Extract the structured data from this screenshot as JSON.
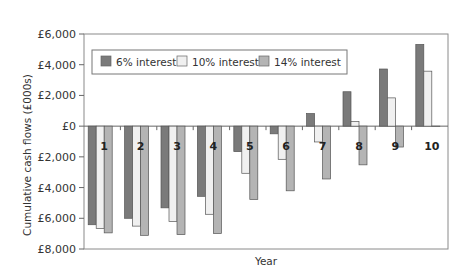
{
  "chart_data": {
    "type": "bar",
    "title": "",
    "xlabel": "Year",
    "ylabel": "Cumulative cash flows (£000s)",
    "categories": [
      "1",
      "2",
      "3",
      "4",
      "5",
      "6",
      "7",
      "8",
      "9",
      "10"
    ],
    "series": [
      {
        "name": "6% interest",
        "color": "#7a7a7a",
        "values": [
          -6420,
          -6000,
          -5320,
          -4570,
          -1660,
          -500,
          820,
          2240,
          3720,
          5320
        ]
      },
      {
        "name": "10% interest",
        "color": "#f0f0f0",
        "values": [
          -6660,
          -6510,
          -6200,
          -5740,
          -3070,
          -2160,
          -1030,
          310,
          1840,
          3580
        ]
      },
      {
        "name": "14% interest",
        "color": "#b4b4b4",
        "values": [
          -6950,
          -7110,
          -7060,
          -6990,
          -4770,
          -4210,
          -3440,
          -2520,
          -1360,
          0
        ]
      }
    ],
    "ylim": [
      -8000,
      6000
    ],
    "yticks": [
      6000,
      4000,
      2000,
      0,
      -2000,
      -4000,
      -6000,
      -8000
    ],
    "ytick_labels": [
      "£6,000",
      "£4,000",
      "£2,000",
      "£0",
      "£2,000",
      "£4,000",
      "£6,000",
      "£8,000"
    ],
    "grid": false,
    "legend_position": "top-inside",
    "category_labels_position": "below-zero-line"
  },
  "legend": {
    "items": [
      {
        "label": "6% interest",
        "color": "#7a7a7a"
      },
      {
        "label": "10% interest",
        "color": "#f0f0f0"
      },
      {
        "label": "14% interest",
        "color": "#b4b4b4"
      }
    ]
  },
  "axes": {
    "x_title": "Year",
    "y_title": "Cumulative cash flows (£000s)"
  }
}
